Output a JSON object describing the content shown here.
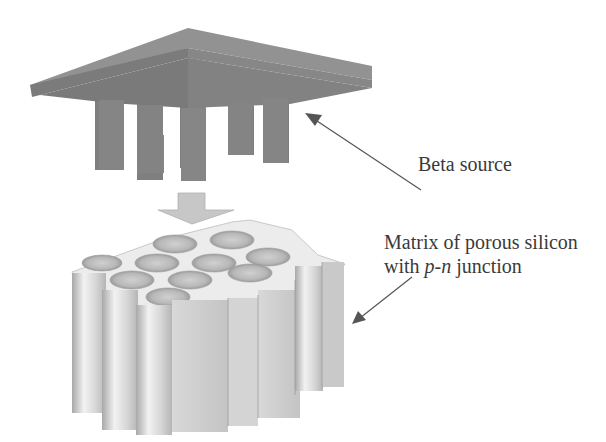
{
  "labels": {
    "beta_source": "Beta source",
    "matrix_line1": "Matrix of porous silicon",
    "matrix_line2_prefix": "with ",
    "matrix_line2_italic": "p-n",
    "matrix_line2_suffix": " junction"
  },
  "colors": {
    "source_top": "#8f8f8f",
    "source_front": "#7a7a7a",
    "pillar": "#808080",
    "matrix_light": "#e8e8e8",
    "matrix_mid": "#cfcfcf",
    "matrix_dark": "#a9a9a9",
    "arrow": "#555555",
    "text": "#3a3a3a"
  }
}
